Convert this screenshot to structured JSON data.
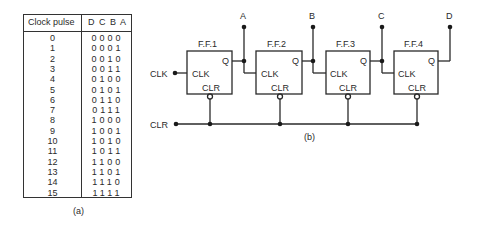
{
  "table": {
    "headers": {
      "pulse": "Clock pulse",
      "bits": "D C B A"
    },
    "rows": [
      {
        "pulse": "0",
        "bits": "0000"
      },
      {
        "pulse": "1",
        "bits": "0001"
      },
      {
        "pulse": "2",
        "bits": "0010"
      },
      {
        "pulse": "3",
        "bits": "0011"
      },
      {
        "pulse": "4",
        "bits": "0100"
      },
      {
        "pulse": "5",
        "bits": "0101"
      },
      {
        "pulse": "6",
        "bits": "0110"
      },
      {
        "pulse": "7",
        "bits": "0111"
      },
      {
        "pulse": "8",
        "bits": "1000"
      },
      {
        "pulse": "9",
        "bits": "1001"
      },
      {
        "pulse": "10",
        "bits": "1010"
      },
      {
        "pulse": "11",
        "bits": "1011"
      },
      {
        "pulse": "12",
        "bits": "1100"
      },
      {
        "pulse": "13",
        "bits": "1101"
      },
      {
        "pulse": "14",
        "bits": "1110"
      },
      {
        "pulse": "15",
        "bits": "1111"
      }
    ],
    "caption": "(a)"
  },
  "circuit": {
    "caption": "(b)",
    "clk_input": "CLK",
    "clr_input": "CLR",
    "flipflops": [
      {
        "name": "F.F.1",
        "q": "Q",
        "clk": "CLK",
        "clr": "CLR",
        "output": "A"
      },
      {
        "name": "F.F.2",
        "q": "Q",
        "clk": "CLK",
        "clr": "CLR",
        "output": "B"
      },
      {
        "name": "F.F.3",
        "q": "Q",
        "clk": "CLK",
        "clr": "CLR",
        "output": "C"
      },
      {
        "name": "F.F.4",
        "q": "Q",
        "clk": "CLK",
        "clr": "CLR",
        "output": "D"
      }
    ]
  }
}
